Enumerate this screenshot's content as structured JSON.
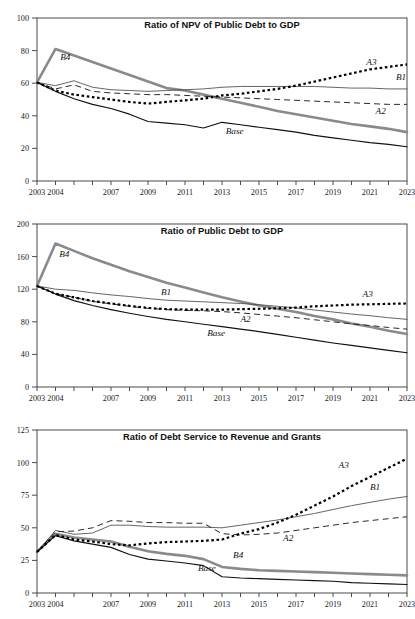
{
  "figure": {
    "width": 415,
    "height": 619,
    "background": "#ffffff",
    "series_styles": {
      "Base": {
        "color": "#111111",
        "style": "solid-thin"
      },
      "B1": {
        "color": "#4a4a4a",
        "style": "solid-hairline"
      },
      "B4": {
        "color": "#8a8a8a",
        "style": "solid-thick-gray"
      },
      "A2": {
        "color": "#2a2a2a",
        "style": "dashed"
      },
      "A3": {
        "color": "#000000",
        "style": "dotted-thick"
      }
    }
  },
  "chart_data": [
    {
      "type": "line",
      "title": "Ratio of NPV of Public Debt to GDP",
      "xlabel": "",
      "ylabel": "",
      "grid": false,
      "legend": "inline-labels",
      "xlim": [
        2003,
        2023
      ],
      "ylim": [
        0,
        100
      ],
      "yticks": [
        0,
        20,
        40,
        60,
        80,
        100
      ],
      "xticks": [
        2003,
        2004,
        2005,
        2006,
        2007,
        2008,
        2009,
        2010,
        2011,
        2012,
        2013,
        2014,
        2015,
        2016,
        2017,
        2018,
        2019,
        2020,
        2021,
        2022,
        2023
      ],
      "xticklabels": [
        "2003",
        "2004",
        "",
        "",
        "2007",
        "",
        "2009",
        "",
        "2011",
        "",
        "2013",
        "",
        "2015",
        "",
        "2017",
        "",
        "2019",
        "",
        "2021",
        "",
        "2023"
      ],
      "x": [
        2003,
        2004,
        2005,
        2006,
        2007,
        2008,
        2009,
        2010,
        2011,
        2012,
        2013,
        2014,
        2015,
        2016,
        2017,
        2018,
        2019,
        2020,
        2021,
        2022,
        2023
      ],
      "series": [
        {
          "name": "Base",
          "label": "Base",
          "values": [
            60.5,
            55.0,
            50.5,
            47.0,
            44.5,
            41.0,
            36.5,
            35.5,
            34.5,
            32.5,
            36.0,
            34.5,
            33.0,
            31.5,
            30.0,
            28.0,
            26.5,
            25.0,
            23.5,
            22.5,
            21.0
          ]
        },
        {
          "name": "B1",
          "label": "B1",
          "values": [
            60.5,
            58.5,
            61.5,
            57.5,
            56.0,
            55.5,
            55.0,
            55.5,
            56.0,
            56.5,
            57.5,
            58.0,
            58.0,
            58.0,
            58.0,
            58.0,
            57.5,
            57.0,
            57.0,
            56.5,
            56.5
          ]
        },
        {
          "name": "B4",
          "label": "B4",
          "values": [
            60.5,
            81.0,
            77.0,
            73.0,
            69.0,
            65.0,
            61.0,
            57.0,
            55.5,
            53.0,
            50.5,
            48.0,
            45.5,
            43.0,
            41.0,
            39.0,
            37.0,
            35.0,
            33.5,
            32.0,
            30.0
          ]
        },
        {
          "name": "A2",
          "label": "A2",
          "values": [
            60.5,
            56.5,
            59.0,
            55.0,
            54.0,
            53.5,
            53.0,
            53.0,
            52.5,
            52.0,
            51.5,
            51.0,
            50.5,
            50.0,
            49.5,
            49.0,
            48.5,
            48.0,
            47.5,
            47.0,
            47.0
          ]
        },
        {
          "name": "A3",
          "label": "A3",
          "values": [
            60.5,
            55.5,
            53.0,
            51.5,
            50.0,
            48.5,
            47.5,
            48.5,
            49.5,
            50.5,
            52.5,
            53.5,
            55.0,
            56.5,
            58.5,
            61.0,
            63.5,
            66.0,
            68.5,
            70.0,
            71.5
          ]
        }
      ],
      "annotations": [
        {
          "text": "B4",
          "x": 2004.25,
          "y": 74.5
        },
        {
          "text": "B1",
          "x": 2022.4,
          "y": 62.0
        },
        {
          "text": "A3",
          "x": 2020.8,
          "y": 71.0
        },
        {
          "text": "A2",
          "x": 2021.3,
          "y": 41.0
        },
        {
          "text": "Base",
          "x": 2013.2,
          "y": 29.0
        }
      ]
    },
    {
      "type": "line",
      "title": "Ratio of Public Debt to GDP",
      "xlabel": "",
      "ylabel": "",
      "grid": false,
      "legend": "inline-labels",
      "xlim": [
        2003,
        2023
      ],
      "ylim": [
        0,
        200
      ],
      "yticks": [
        0,
        40,
        80,
        120,
        160,
        200
      ],
      "xticks": [
        2003,
        2004,
        2005,
        2006,
        2007,
        2008,
        2009,
        2010,
        2011,
        2012,
        2013,
        2014,
        2015,
        2016,
        2017,
        2018,
        2019,
        2020,
        2021,
        2022,
        2023
      ],
      "xticklabels": [
        "2003",
        "2004",
        "",
        "",
        "2007",
        "",
        "2009",
        "",
        "2011",
        "",
        "2013",
        "",
        "2015",
        "",
        "2017",
        "",
        "2019",
        "",
        "2021",
        "",
        "2023"
      ],
      "x": [
        2003,
        2004,
        2005,
        2006,
        2007,
        2008,
        2009,
        2010,
        2011,
        2012,
        2013,
        2014,
        2015,
        2016,
        2017,
        2018,
        2019,
        2020,
        2021,
        2022,
        2023
      ],
      "series": [
        {
          "name": "Base",
          "label": "Base",
          "values": [
            124.0,
            114.0,
            106.0,
            100.0,
            95.0,
            90.5,
            86.5,
            83.0,
            80.0,
            77.0,
            74.0,
            71.0,
            68.0,
            64.5,
            61.0,
            57.5,
            54.0,
            51.0,
            48.0,
            45.0,
            42.0
          ]
        },
        {
          "name": "B1",
          "label": "B1",
          "values": [
            124.0,
            120.0,
            118.5,
            115.5,
            113.0,
            111.0,
            108.5,
            106.5,
            105.5,
            104.5,
            103.5,
            102.5,
            101.0,
            99.0,
            97.0,
            94.5,
            92.0,
            89.5,
            87.5,
            85.0,
            83.0
          ]
        },
        {
          "name": "B4",
          "label": "B4",
          "values": [
            124.0,
            176.0,
            167.0,
            158.0,
            150.0,
            142.0,
            135.0,
            128.0,
            122.0,
            116.0,
            110.0,
            105.0,
            100.0,
            96.0,
            92.0,
            87.0,
            83.0,
            78.0,
            74.0,
            69.0,
            65.0
          ]
        },
        {
          "name": "A2",
          "label": "A2",
          "values": [
            124.0,
            114.5,
            110.0,
            105.0,
            102.0,
            99.0,
            96.5,
            95.0,
            94.0,
            93.5,
            92.5,
            91.0,
            89.0,
            87.0,
            85.0,
            82.5,
            80.0,
            77.5,
            75.5,
            73.0,
            71.0
          ]
        },
        {
          "name": "A3",
          "label": "A3",
          "values": [
            124.0,
            114.5,
            110.0,
            105.5,
            102.5,
            99.5,
            97.0,
            95.5,
            95.0,
            95.0,
            95.0,
            95.5,
            96.0,
            96.5,
            97.5,
            99.0,
            100.0,
            101.0,
            101.5,
            102.0,
            102.5
          ]
        }
      ],
      "annotations": [
        {
          "text": "B4",
          "x": 2004.2,
          "y": 160.0
        },
        {
          "text": "B1",
          "x": 2009.7,
          "y": 113.0
        },
        {
          "text": "A3",
          "x": 2020.6,
          "y": 110.0
        },
        {
          "text": "A2",
          "x": 2014.0,
          "y": 80.0
        },
        {
          "text": "Base",
          "x": 2012.2,
          "y": 62.0
        }
      ]
    },
    {
      "type": "line",
      "title": "Ratio of Debt Service to Revenue and Grants",
      "xlabel": "",
      "ylabel": "",
      "grid": false,
      "legend": "inline-labels",
      "xlim": [
        2003,
        2023
      ],
      "ylim": [
        0,
        125
      ],
      "yticks": [
        0,
        25,
        50,
        75,
        100,
        125
      ],
      "xticks": [
        2003,
        2004,
        2005,
        2006,
        2007,
        2008,
        2009,
        2010,
        2011,
        2012,
        2013,
        2014,
        2015,
        2016,
        2017,
        2018,
        2019,
        2020,
        2021,
        2022,
        2023
      ],
      "xticklabels": [
        "2003",
        "2004",
        "",
        "",
        "2007",
        "",
        "2009",
        "",
        "2011",
        "",
        "2013",
        "",
        "2015",
        "",
        "2017",
        "",
        "2019",
        "",
        "2021",
        "",
        "2023"
      ],
      "x": [
        2003,
        2004,
        2005,
        2006,
        2007,
        2008,
        2009,
        2010,
        2011,
        2012,
        2013,
        2014,
        2015,
        2016,
        2017,
        2018,
        2019,
        2020,
        2021,
        2022,
        2023
      ],
      "series": [
        {
          "name": "Base",
          "label": "Base",
          "values": [
            31.5,
            44.0,
            40.0,
            37.5,
            35.0,
            29.5,
            26.0,
            24.5,
            23.0,
            21.0,
            12.5,
            11.5,
            11.0,
            10.5,
            10.0,
            9.5,
            9.0,
            8.0,
            7.5,
            7.0,
            6.5
          ]
        },
        {
          "name": "B1",
          "label": "B1",
          "values": [
            31.5,
            48.0,
            45.0,
            46.0,
            52.0,
            52.0,
            51.0,
            50.5,
            50.5,
            50.5,
            50.0,
            52.0,
            54.0,
            56.0,
            58.5,
            61.0,
            64.0,
            67.0,
            69.5,
            72.0,
            74.0
          ]
        },
        {
          "name": "B4",
          "label": "B4",
          "values": [
            31.5,
            45.5,
            42.5,
            41.0,
            39.5,
            35.5,
            32.0,
            30.0,
            28.5,
            26.0,
            20.0,
            18.5,
            17.5,
            17.0,
            16.5,
            16.0,
            15.5,
            15.0,
            14.5,
            14.0,
            13.5
          ]
        },
        {
          "name": "A2",
          "label": "A2",
          "values": [
            31.5,
            47.0,
            47.5,
            50.0,
            55.5,
            55.0,
            54.0,
            54.0,
            53.5,
            53.5,
            45.5,
            44.5,
            45.0,
            46.0,
            48.0,
            50.0,
            52.0,
            54.0,
            55.5,
            57.0,
            58.5
          ]
        },
        {
          "name": "A3",
          "label": "A3",
          "values": [
            31.5,
            44.5,
            41.0,
            39.5,
            37.5,
            36.5,
            38.0,
            39.0,
            39.5,
            40.0,
            41.0,
            45.5,
            49.0,
            54.0,
            60.0,
            67.0,
            74.0,
            82.0,
            89.0,
            96.0,
            103.0
          ]
        }
      ],
      "annotations": [
        {
          "text": "A3",
          "x": 2019.3,
          "y": 96.0
        },
        {
          "text": "B1",
          "x": 2021.0,
          "y": 79.0
        },
        {
          "text": "A2",
          "x": 2016.3,
          "y": 40.0
        },
        {
          "text": "B4",
          "x": 2013.6,
          "y": 26.5
        },
        {
          "text": "Base",
          "x": 2011.7,
          "y": 16.5
        }
      ]
    }
  ]
}
